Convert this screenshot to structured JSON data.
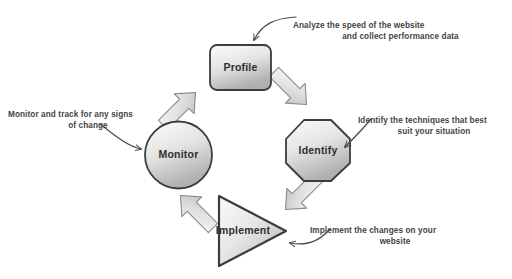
{
  "diagram": {
    "type": "cycle-diagram",
    "palette": {
      "shape_fill_light": "#f2f2f2",
      "shape_fill_dark": "#b8b8b8",
      "shape_stroke": "#3c3c3c",
      "arrow_fill": "#dcdcdc",
      "arrow_stroke": "#6e6e6e",
      "leader_stroke": "#4a4a4a",
      "text_color": "#444444",
      "background": "#ffffff"
    },
    "nodes": [
      {
        "id": "profile",
        "label": "Profile",
        "shape": "rounded-rectangle",
        "position": "top"
      },
      {
        "id": "identify",
        "label": "Identify",
        "shape": "octagon",
        "position": "right"
      },
      {
        "id": "implement",
        "label": "Implement",
        "shape": "triangle",
        "position": "bottom"
      },
      {
        "id": "monitor",
        "label": "Monitor",
        "shape": "circle",
        "position": "left"
      }
    ],
    "flow_arrows": [
      {
        "id": "monitor-to-profile",
        "from": "monitor",
        "to": "profile",
        "direction": "up-right"
      },
      {
        "id": "profile-to-identify",
        "from": "profile",
        "to": "identify",
        "direction": "down-right"
      },
      {
        "id": "identify-to-implement",
        "from": "identify",
        "to": "implement",
        "direction": "down-left"
      },
      {
        "id": "implement-to-monitor",
        "from": "implement",
        "to": "monitor",
        "direction": "up-left"
      }
    ],
    "callouts": [
      {
        "id": "analyze",
        "target": "profile",
        "line1": "Analyze the speed of the website",
        "line2": "and collect performance data"
      },
      {
        "id": "identify",
        "target": "identify",
        "line1": "Identify the techniques that best",
        "line2": "suit your situation"
      },
      {
        "id": "monitor",
        "target": "monitor",
        "line1": "Monitor and track for any signs",
        "line2": "of change"
      },
      {
        "id": "implement",
        "target": "implement",
        "line1": "Implement the changes on your",
        "line2": "website"
      }
    ]
  }
}
